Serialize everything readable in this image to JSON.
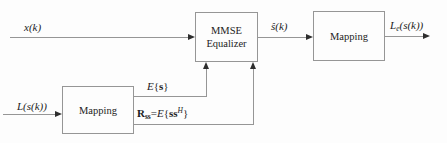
{
  "figure": {
    "type": "block-diagram",
    "background": "#fdfdfd",
    "line_color": "#969696",
    "arrow_color": "#2e2e2e",
    "text_color": "#1c1c1c"
  },
  "boxes": {
    "mmse": {
      "line1": "MMSE",
      "line2": "Equalizer"
    },
    "mapping_top": {
      "label": "Mapping"
    },
    "mapping_bottom": {
      "label": "Mapping"
    }
  },
  "labels": {
    "x_input": "x(k)",
    "s_hat": "ŝ(k)",
    "le_output": {
      "base": "L",
      "sub": "e",
      "args": "(s(k))"
    },
    "l_input": "L(s(k))",
    "mean": {
      "e": "E",
      "open": "{",
      "s": "s",
      "close": "}"
    },
    "cov": {
      "r": "R",
      "r_sub": "ss",
      "eq": "=",
      "e": "E",
      "open": "{",
      "ss": "ss",
      "sup": "H",
      "close": "}"
    }
  }
}
